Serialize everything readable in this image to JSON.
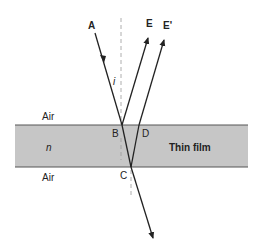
{
  "diagram": {
    "film": {
      "label": "Thin film",
      "index_label": "n",
      "fill": "#c6c6c6",
      "edge": "#555555"
    },
    "media": {
      "top": "Air",
      "bottom": "Air"
    },
    "points": {
      "A": "A",
      "B": "B",
      "C": "C",
      "D": "D",
      "E": "E",
      "E_prime": "E'"
    },
    "angle_label": "i"
  }
}
